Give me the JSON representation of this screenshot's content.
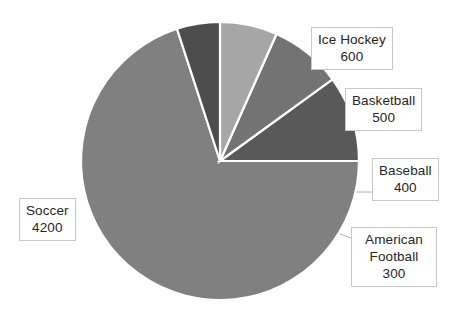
{
  "chart_data": {
    "type": "pie",
    "title": "",
    "categories": [
      "Soccer",
      "Ice Hockey",
      "Basketball",
      "Baseball",
      "American Football"
    ],
    "values": [
      4200,
      600,
      500,
      400,
      300
    ],
    "total": 6000,
    "legend_position": "none",
    "labels_position": "callout-outside",
    "grid": false,
    "slices": [
      {
        "label": "Soccer",
        "value": "4200",
        "number": 4200,
        "color": "#808080",
        "angle_deg": 252,
        "start_deg": 108,
        "end_deg": 360
      },
      {
        "label": "Ice Hockey",
        "value": "600",
        "number": 600,
        "color": "#595959",
        "angle_deg": 36,
        "start_deg": 0,
        "end_deg": 36
      },
      {
        "label": "Basketball",
        "value": "500",
        "number": 500,
        "color": "#737373",
        "angle_deg": 30,
        "start_deg": 36,
        "end_deg": 66
      },
      {
        "label": "Baseball",
        "value": "400",
        "number": 400,
        "color": "#a6a6a6",
        "angle_deg": 24,
        "start_deg": 66,
        "end_deg": 90
      },
      {
        "label": "American Football",
        "value": "300",
        "number": 300,
        "color": "#4d4d4d",
        "angle_deg": 18,
        "start_deg": 90,
        "end_deg": 108
      }
    ]
  },
  "callouts": {
    "ice_hockey": {
      "category": "Ice Hockey",
      "value": "600"
    },
    "basketball": {
      "category": "Basketball",
      "value": "500"
    },
    "baseball": {
      "category": "Baseball",
      "value": "400"
    },
    "american_football": {
      "category": "American",
      "category2": "Football",
      "value": "300"
    },
    "soccer": {
      "category": "Soccer",
      "value": "4200"
    }
  },
  "colors": {
    "background": "#ffffff",
    "slice_border": "#ffffff",
    "callout_border": "#c8c8c8",
    "callout_background": "#ffffff",
    "text": "#262626",
    "leader_line": "#b0b0b0"
  }
}
